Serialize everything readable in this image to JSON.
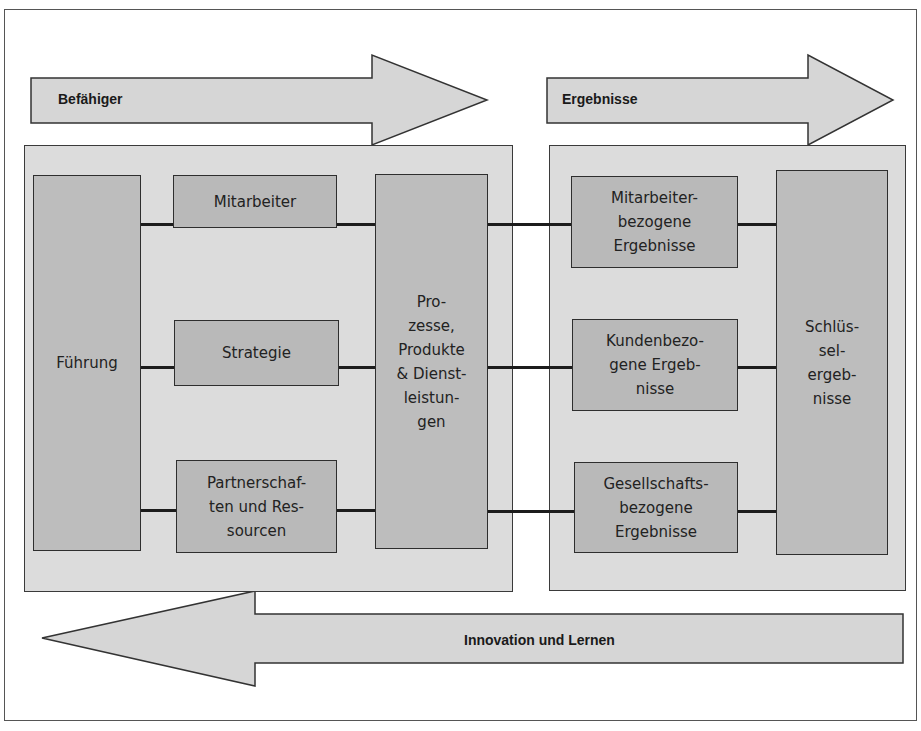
{
  "diagram": {
    "arrows": {
      "enablers": {
        "label": "Befähiger",
        "direction": "right"
      },
      "results": {
        "label": "Ergebnisse",
        "direction": "right"
      },
      "feedback": {
        "label": "Innovation und Lernen",
        "direction": "left"
      }
    },
    "enablers_panel": {
      "leadership": {
        "label": "Führung"
      },
      "people": {
        "label": "Mitarbeiter"
      },
      "strategy": {
        "label": "Strategie"
      },
      "partnerships": {
        "label": "Partnerschaf-\nten und Res-\nsourcen"
      },
      "processes": {
        "label": "Pro-\nzesse,\nProdukte\n& Dienst-\nleistun-\ngen"
      }
    },
    "results_panel": {
      "people_results": {
        "label": "Mitarbeiter-\nbezogene\nErgebnisse"
      },
      "customer_results": {
        "label": "Kundenbezo-\ngene Ergeb-\nnisse"
      },
      "society_results": {
        "label": "Gesellschafts-\nbezogene\nErgebnisse"
      },
      "key_results": {
        "label": "Schlüs-\nsel-\nergeb-\nnisse"
      }
    },
    "colors": {
      "arrow_fill": "#d6d6d6",
      "panel_fill": "#dcdcdc",
      "box_fill": "#b9b9b9",
      "stroke": "#2e2e2e"
    }
  }
}
